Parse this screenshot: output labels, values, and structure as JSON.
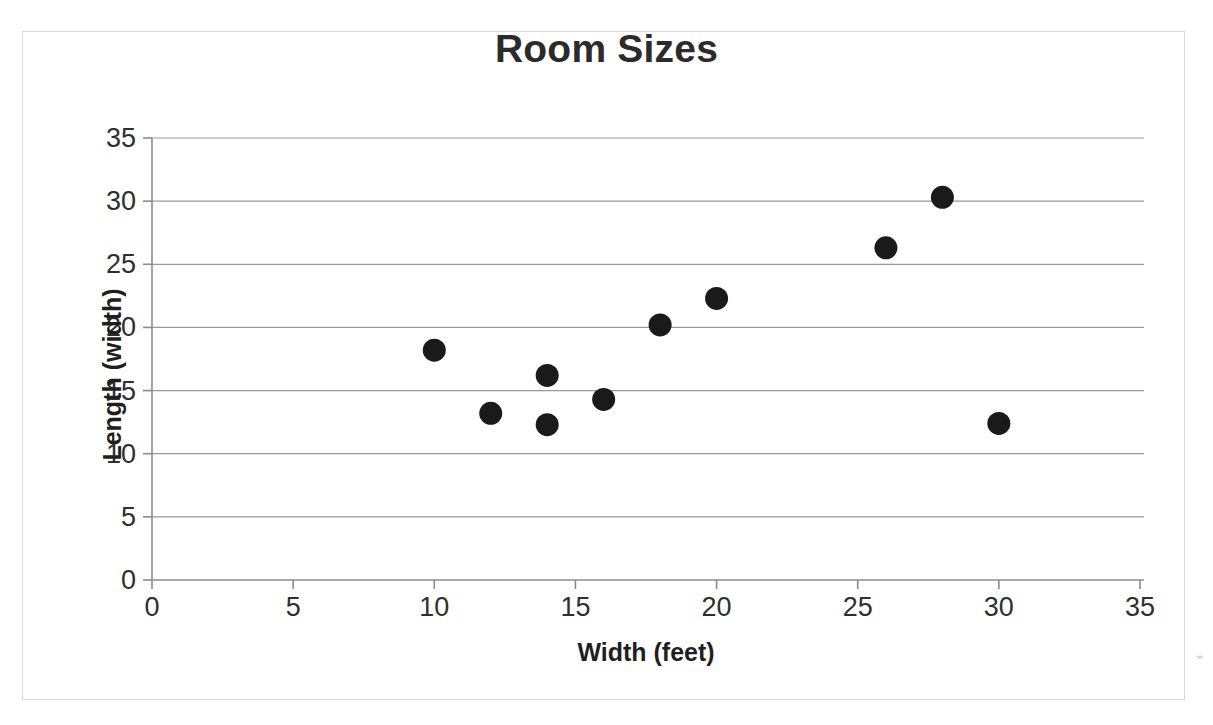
{
  "chart_data": {
    "type": "scatter",
    "title": "Room Sizes",
    "xlabel": "Width (feet)",
    "ylabel": "Length (width)",
    "xlim": [
      0,
      35
    ],
    "ylim": [
      0,
      35
    ],
    "xticks": [
      0,
      5,
      10,
      15,
      20,
      25,
      30,
      35
    ],
    "yticks": [
      0,
      5,
      10,
      15,
      20,
      25,
      30,
      35
    ],
    "xtick_labels": [
      "0",
      "5",
      "10",
      "15",
      "20",
      "25",
      "30",
      "35"
    ],
    "ytick_labels": [
      "0",
      "5",
      "10",
      "15",
      "20",
      "25",
      "30",
      "35"
    ],
    "grid": "horizontal",
    "legend": null,
    "series": [
      {
        "name": "Room Sizes",
        "marker": "circle",
        "color": "#1a1a1a",
        "points": [
          {
            "x": 10,
            "y": 18.2
          },
          {
            "x": 12,
            "y": 13.2
          },
          {
            "x": 14,
            "y": 16.2
          },
          {
            "x": 14,
            "y": 12.3
          },
          {
            "x": 16,
            "y": 14.3
          },
          {
            "x": 18,
            "y": 20.2
          },
          {
            "x": 20,
            "y": 22.3
          },
          {
            "x": 26,
            "y": 26.3
          },
          {
            "x": 28,
            "y": 30.3
          },
          {
            "x": 30,
            "y": 12.4
          }
        ]
      }
    ]
  },
  "style": {
    "marker_color": "#1a1a1a",
    "grid_color": "#999999",
    "axis_color": "#8c8c8c",
    "frame_color": "#d8d8d8",
    "title_color": "#2b2b2b",
    "background": "#ffffff"
  },
  "artifact": {
    "glyph": "⌁"
  }
}
